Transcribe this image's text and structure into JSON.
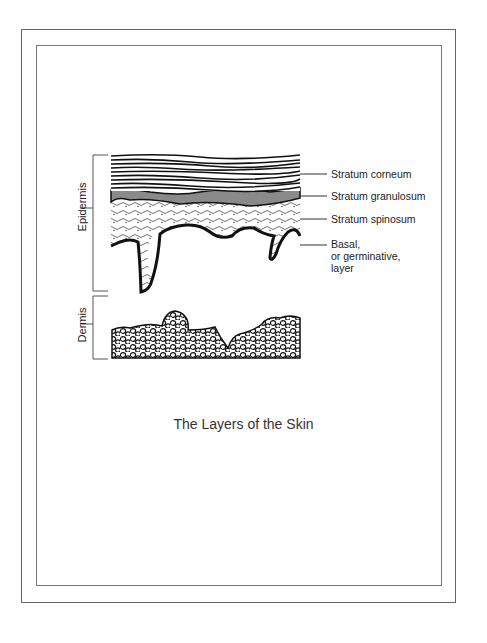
{
  "figure": {
    "caption": "The Layers of the Skin",
    "regions": {
      "epidermis": "Epidermis",
      "dermis": "Dermis"
    },
    "layers": [
      {
        "label": "Stratum corneum"
      },
      {
        "label": "Stratum granulosum"
      },
      {
        "label": "Stratum spinosum"
      },
      {
        "label_lines": [
          "Basal,",
          "or germinative,",
          "layer"
        ]
      }
    ]
  }
}
